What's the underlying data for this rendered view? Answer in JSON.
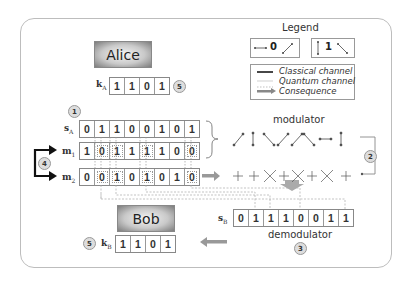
{
  "parties": {
    "alice": "Alice",
    "bob": "Bob"
  },
  "legend": {
    "title": "Legend",
    "bit0": {
      "value": "0",
      "bases": [
        "horizontal",
        "diagonal-45"
      ]
    },
    "bit1": {
      "value": "1",
      "bases": [
        "vertical",
        "diagonal-135"
      ]
    },
    "lines": [
      {
        "style": "solid-thick",
        "label": "Classical channel"
      },
      {
        "style": "thin",
        "label": "Quantum channel"
      },
      {
        "style": "arrow-dotted",
        "label": "Consequence"
      }
    ]
  },
  "alice": {
    "key_label": "k",
    "key_sub": "A",
    "key": [
      "1",
      "1",
      "0",
      "1"
    ],
    "key_step": "5",
    "s_label": "s",
    "s_sub": "A",
    "s_bits": [
      "0",
      "1",
      "1",
      "0",
      "0",
      "1",
      "0",
      "1"
    ],
    "m1_label": "m",
    "m1_sub": "1",
    "m1_bits": [
      "1",
      "0",
      "1",
      "1",
      "1",
      "1",
      "0",
      "0"
    ],
    "m2_label": "m",
    "m2_sub": "2",
    "m2_bits": [
      "0",
      "0",
      "1",
      "0",
      "1",
      "0",
      "1",
      "0"
    ],
    "step1": "1",
    "step4": "4"
  },
  "modulator": {
    "label": "modulator",
    "states": [
      "/",
      "|",
      "\\",
      "/",
      "/",
      "\\",
      "—",
      "|"
    ],
    "bases": [
      "+",
      "+",
      "×",
      "+",
      "×",
      "+",
      "×",
      "+"
    ],
    "step": "2"
  },
  "bob": {
    "s_label": "s",
    "s_sub": "B",
    "s_bits": [
      "0",
      "1",
      "1",
      "1",
      "0",
      "0",
      "1",
      "1"
    ],
    "demodulator_label": "demodulator",
    "demod_step": "3",
    "key_label": "k",
    "key_sub": "B",
    "key": [
      "1",
      "1",
      "0",
      "1"
    ],
    "key_step": "5"
  },
  "colors": {
    "frame": "#bdbdbd",
    "box_border": "#888888",
    "arrow": "#9a9a9a",
    "black_arrow": "#111111"
  }
}
